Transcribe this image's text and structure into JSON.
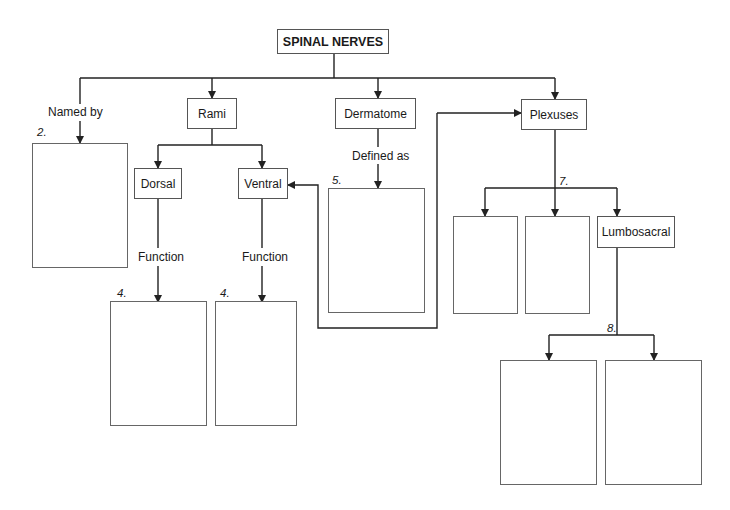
{
  "diagram": {
    "title": "SPINAL NERVES",
    "branches": {
      "named_by": {
        "edge_label": "Named by",
        "blank_number": "2."
      },
      "rami": {
        "label": "Rami",
        "children": [
          {
            "label": "Dorsal",
            "edge_label": "Function",
            "blank_number": "4."
          },
          {
            "label": "Ventral",
            "edge_label": "Function",
            "blank_number": "4."
          }
        ]
      },
      "dermatome": {
        "label": "Dermatome",
        "edge_label": "Defined as",
        "blank_number": "5."
      },
      "plexuses": {
        "label": "Plexuses",
        "children_number": "7.",
        "children": [
          {
            "label": ""
          },
          {
            "label": ""
          },
          {
            "label": "Lumbosacral",
            "children_number": "8."
          }
        ]
      }
    },
    "colors": {
      "line": "#222222",
      "box_border": "#555555",
      "background": "#ffffff"
    }
  }
}
